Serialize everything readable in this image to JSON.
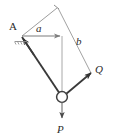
{
  "figure": {
    "background_color": "#ffffff",
    "width": 113,
    "height": 140,
    "labels": {
      "point_A": "A",
      "side_a": "a",
      "side_b": "b",
      "force_Q": "Q",
      "force_P": "P"
    },
    "colors": {
      "thin_line": "#9a9a9a",
      "thick_line": "#3a3a3a",
      "text": "#2b2b2b",
      "pin_fill": "#ffffff"
    },
    "geometry": {
      "point_A": [
        21,
        37
      ],
      "apex": [
        57,
        7
      ],
      "pin_joint": [
        62,
        97
      ],
      "pin_radius": 5.5,
      "arrow_Q_tip": [
        93,
        74
      ],
      "arrow_P_tip": [
        62,
        121
      ],
      "arrow_a_tip": [
        62,
        36
      ]
    },
    "elements": [
      "support-hatching-at-A",
      "two-force-member-A-to-pin",
      "vector-a-horizontal",
      "vector-b-diagonal",
      "parallelogram-construction-lines",
      "vector-Q-toward-lower-right",
      "vector-P-downward",
      "pin-circle-joint"
    ]
  }
}
